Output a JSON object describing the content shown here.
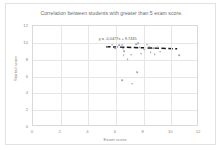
{
  "chart_data": {
    "type": "scatter",
    "title": "Correlation between students with greater than 5 exam score.",
    "xlabel": "Exam score",
    "ylabel": "Started score",
    "xlim": [
      0,
      12
    ],
    "ylim": [
      0,
      12
    ],
    "xticks": [
      0,
      2,
      4,
      6,
      8,
      10,
      12
    ],
    "yticks": [
      0,
      2,
      4,
      6,
      8,
      10,
      12
    ],
    "grid": true,
    "legend": "none",
    "point_color": "#9aa4b0",
    "trendline_color": "#1a1a1a",
    "trendline_style": "dashed",
    "trendline_equation": "y = -0.0477x + 9.7435",
    "trendline_slope": -0.0477,
    "trendline_intercept": 9.7435,
    "points": [
      {
        "x": 5.35,
        "y": 9.55
      },
      {
        "x": 5.7,
        "y": 9.8
      },
      {
        "x": 5.95,
        "y": 9.4
      },
      {
        "x": 6.25,
        "y": 9.75
      },
      {
        "x": 6.4,
        "y": 9.6
      },
      {
        "x": 6.45,
        "y": 9.8
      },
      {
        "x": 6.5,
        "y": 9.3
      },
      {
        "x": 6.55,
        "y": 8.55
      },
      {
        "x": 6.6,
        "y": 9.05
      },
      {
        "x": 6.85,
        "y": 8.1
      },
      {
        "x": 7.1,
        "y": 8.6
      },
      {
        "x": 7.45,
        "y": 9.85
      },
      {
        "x": 7.6,
        "y": 9.95
      },
      {
        "x": 7.7,
        "y": 9.45
      },
      {
        "x": 7.8,
        "y": 8.7
      },
      {
        "x": 8.05,
        "y": 9.2
      },
      {
        "x": 8.25,
        "y": 9.8
      },
      {
        "x": 8.4,
        "y": 9.55
      },
      {
        "x": 8.5,
        "y": 8.9
      },
      {
        "x": 8.7,
        "y": 9.4
      },
      {
        "x": 8.8,
        "y": 8.65
      },
      {
        "x": 9.0,
        "y": 9.5
      },
      {
        "x": 9.2,
        "y": 8.95
      },
      {
        "x": 10.55,
        "y": 8.55
      },
      {
        "x": 7.55,
        "y": 6.55
      },
      {
        "x": 6.45,
        "y": 5.6
      },
      {
        "x": 7.15,
        "y": 5.15
      }
    ]
  }
}
